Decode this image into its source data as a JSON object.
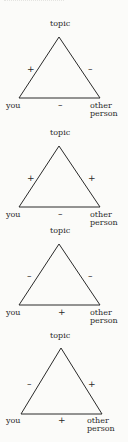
{
  "diagram": {
    "vertex_labels": {
      "top": "topic",
      "left": "you",
      "right_line1": "other",
      "right_line2": "person"
    },
    "triangles": [
      {
        "you_topic": "+",
        "other_topic": "–",
        "you_other": "–"
      },
      {
        "you_topic": "+",
        "other_topic": "+",
        "you_other": "–"
      },
      {
        "you_topic": "–",
        "other_topic": "–",
        "you_other": "+"
      },
      {
        "you_topic": "–",
        "other_topic": "+",
        "you_other": "+"
      }
    ],
    "line_color": "#2a2a2a"
  }
}
